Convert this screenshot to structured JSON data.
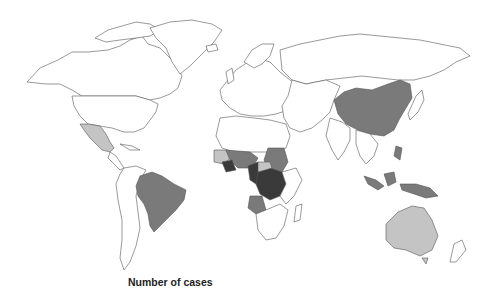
{
  "map": {
    "type": "choropleth-world",
    "color_scale": {
      "none": "#ffffff",
      "low": "#c4c4c4",
      "medium": "#7a7a7a",
      "high": "#3a3a3a",
      "stroke": "#555555"
    },
    "regions": {
      "low": [
        "Mexico",
        "Australia",
        "Guinea",
        "Sierra Leone",
        "Central African Republic (part)",
        "Gabon/Congo area (part)"
      ],
      "medium": [
        "Brazil",
        "China",
        "Indonesia",
        "Papua New Guinea",
        "Sudan",
        "Nigeria",
        "Angola",
        "Ghana/Togo/Benin area",
        "Cameroon (part)",
        "Malaysia",
        "Philippines"
      ],
      "high": [
        "Democratic Republic of the Congo",
        "Côte d'Ivoire",
        "Cameroon",
        "Congo"
      ]
    }
  },
  "legend": {
    "title": "Number of cases"
  }
}
